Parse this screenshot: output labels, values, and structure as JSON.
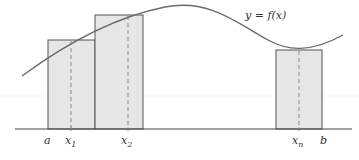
{
  "diagram": {
    "curve_label": "y = f(x)",
    "axis_labels": {
      "a": "a",
      "x1": "x",
      "x1_sub": "1",
      "x2": "x",
      "x2_sub": "2",
      "xn": "x",
      "xn_sub": "n",
      "b": "b"
    },
    "colors": {
      "curve": "#6a6a6a",
      "rect_fill": "#e6e6e6",
      "rect_stroke": "#555555",
      "axis": "#444444",
      "dashed": "#888888"
    },
    "rectangles": [
      {
        "name": "rect-1",
        "x_left": 48,
        "x_right": 95,
        "top": 40,
        "sample_x": 71
      },
      {
        "name": "rect-2",
        "x_left": 95,
        "x_right": 143,
        "top": 15,
        "sample_x": 128
      },
      {
        "name": "rect-n",
        "x_left": 276,
        "x_right": 322,
        "top": 50,
        "sample_x": 299
      }
    ]
  }
}
